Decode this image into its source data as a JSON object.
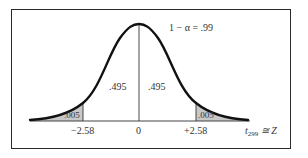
{
  "diagram": {
    "title": "1 − α = .99",
    "distribution": "normal",
    "center_area_left": ".495",
    "center_area_right": ".495",
    "tail_area_left": ".005",
    "tail_area_right": ".005",
    "ticks": [
      "−2.58",
      "0",
      "+2.58"
    ],
    "axis_label_main": "t",
    "axis_label_sub": "299",
    "axis_label_rest": " ≅ Z",
    "colors": {
      "curve": "#111111",
      "shade": "#c8c8c8",
      "frame": "#2a2a2a",
      "text": "#333333"
    }
  }
}
